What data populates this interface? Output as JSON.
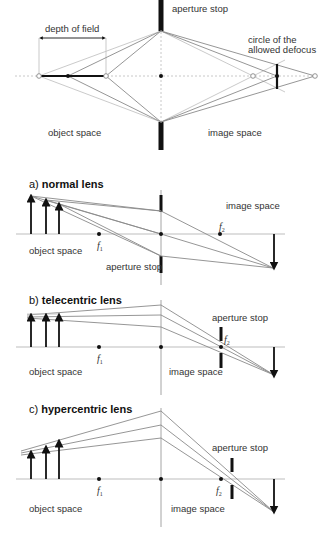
{
  "diagrams": {
    "depth_of_field": {
      "aperture_stop_label": "aperture stop",
      "depth_of_field_label": "depth of field",
      "defocus_label_line1": "circle of the",
      "defocus_label_line2": "allowed defocus",
      "object_space_label": "object space",
      "image_space_label": "image space"
    },
    "normal": {
      "title_prefix": "a) ",
      "title_bold": "normal lens",
      "image_space_label": "image space",
      "object_space_label": "object space",
      "aperture_stop_label": "aperture stop",
      "f1": "f",
      "f1_sub": "1",
      "f2": "f",
      "f2_sub": "2"
    },
    "telecentric": {
      "title_prefix": "b) ",
      "title_bold": "telecentric lens",
      "aperture_stop_label": "aperture stop",
      "object_space_label": "object space",
      "image_space_label": "image space",
      "f1": "f",
      "f1_sub": "1",
      "f2": "f",
      "f2_sub": "2"
    },
    "hypercentric": {
      "title_prefix": "c) ",
      "title_bold": "hypercentric lens",
      "aperture_stop_label": "aperture stop",
      "object_space_label": "object space",
      "image_space_label": "image space",
      "f1": "f",
      "f1_sub": "1",
      "f2": "f",
      "f2_sub": "2"
    }
  }
}
